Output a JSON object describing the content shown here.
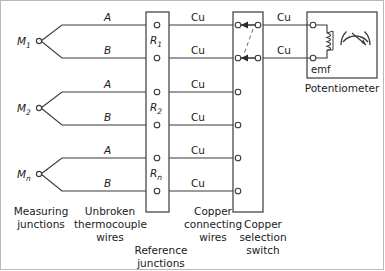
{
  "diagram": {
    "title_labels": {
      "measuring_junctions": "Measuring\njunctions",
      "unbroken_wires": "Unbroken\nthermocouple\nwires",
      "reference_junctions": "Reference\njunctions",
      "copper_connecting_wires": "Copper\nconnecting\nwires",
      "copper_selection_switch": "Copper\nselection\nswitch",
      "potentiometer": "Potentiometer"
    },
    "measuring_junctions": [
      {
        "label": "M",
        "sub": "1"
      },
      {
        "label": "M",
        "sub": "2"
      },
      {
        "label": "M",
        "sub": "n"
      }
    ],
    "reference_junctions": [
      {
        "label": "R",
        "sub": "1"
      },
      {
        "label": "R",
        "sub": "2"
      },
      {
        "label": "R",
        "sub": "n"
      }
    ],
    "thermocouple_wire_labels": [
      "A",
      "B",
      "A",
      "B",
      "A",
      "B"
    ],
    "copper_wire_labels_left": [
      "Cu",
      "Cu",
      "Cu",
      "Cu",
      "Cu",
      "Cu"
    ],
    "copper_wire_labels_right": [
      "Cu",
      "Cu"
    ],
    "potentiometer": {
      "emf_label": "emf",
      "coil_name": "slidewire-coil",
      "meter_name": "galvanometer"
    },
    "colors": {
      "line": "#3a3a3a",
      "text": "#1a1a1a",
      "frame": "#b9b9b9",
      "dashed": "#6a6a6a"
    }
  }
}
